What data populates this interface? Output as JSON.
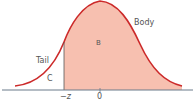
{
  "diagram": {
    "type": "normal-distribution-curve",
    "labels": {
      "body": "Body",
      "tail": "Tail",
      "region_b": "B",
      "region_c": "C",
      "neg_z": "−z",
      "zero": "0"
    },
    "colors": {
      "curve": "#cc2a2a",
      "fill_body": "#f7c0b0",
      "axis": "#6a7a8a",
      "divider": "#555555",
      "text": "#555555"
    }
  }
}
